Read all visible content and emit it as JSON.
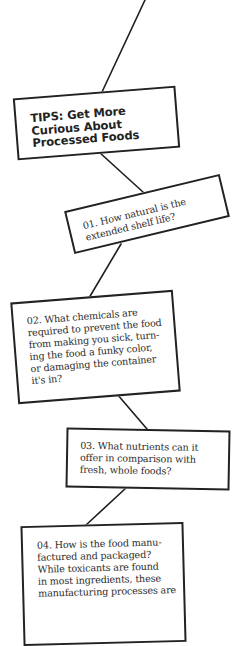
{
  "diagram": {
    "title": "TIPS: Get More\nCurious About\nProcessed Foods",
    "questions": [
      {
        "number": "01.",
        "text": "01. How natural is the\nextended shelf life?"
      },
      {
        "number": "02.",
        "text": "02. What chemicals are\nrequired to prevent the food\nfrom making you sick, turn-\ning the food a funky color,\nor damaging the container\nit's in?"
      },
      {
        "number": "03.",
        "text": "03. What nutrients can it\noffer in comparison with\nfresh, whole foods?"
      },
      {
        "number": "04.",
        "text": "04. How is the food manu-\nfactured and packaged?\nWhile toxicants are found\nin most ingredients, these\nmanufacturing processes are"
      }
    ],
    "colors": {
      "line": "#1e1e1e",
      "border": "#222222",
      "text": "#2a2a2a",
      "background": "#ffffff"
    }
  }
}
